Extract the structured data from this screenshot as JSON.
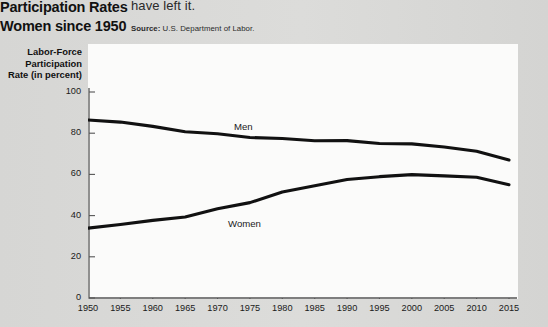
{
  "headline": {
    "line1": "Participation Rates",
    "line2": "Women since 1950"
  },
  "body_fragment": "have left it.",
  "source": {
    "label": "Source:",
    "text": "U.S. Department of Labor."
  },
  "axis_title": {
    "line1": "Labor-Force",
    "line2": "Participation",
    "line3": "Rate (in percent)"
  },
  "colors": {
    "page_background": "#d9d9d7",
    "panel_background": "#fbfbfa",
    "line": "#111111",
    "axis": "#555555",
    "text": "#1a1a1a"
  },
  "chart_data": {
    "type": "line",
    "title": "",
    "xlabel": "",
    "ylabel": "Labor-Force Participation Rate (in percent)",
    "xlim": [
      1950,
      2015
    ],
    "ylim": [
      0,
      100
    ],
    "yticks": [
      0,
      20,
      40,
      60,
      80,
      100
    ],
    "xticks": [
      1950,
      1955,
      1960,
      1965,
      1970,
      1975,
      1980,
      1985,
      1990,
      1995,
      2000,
      2005,
      2010,
      2015
    ],
    "grid": false,
    "legend": "inline-labels",
    "x": [
      1950,
      1955,
      1960,
      1965,
      1970,
      1975,
      1980,
      1985,
      1990,
      1995,
      2000,
      2005,
      2010,
      2015
    ],
    "series": [
      {
        "name": "Men",
        "label": "Men",
        "values": [
          86.4,
          85.4,
          83.3,
          80.7,
          79.7,
          77.9,
          77.4,
          76.3,
          76.4,
          75.0,
          74.8,
          73.3,
          71.2,
          67.0
        ]
      },
      {
        "name": "Women",
        "label": "Women",
        "values": [
          33.9,
          35.7,
          37.7,
          39.3,
          43.3,
          46.3,
          51.5,
          54.5,
          57.5,
          58.9,
          59.9,
          59.3,
          58.6,
          55.0
        ]
      }
    ]
  }
}
